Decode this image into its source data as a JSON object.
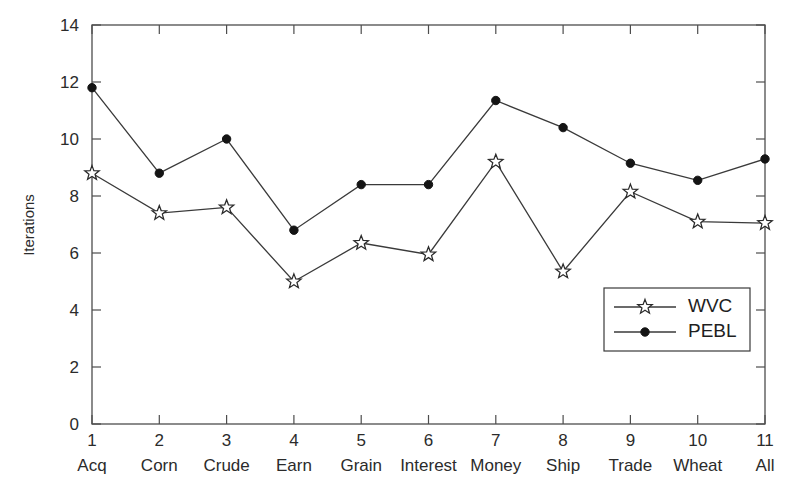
{
  "chart_data": {
    "type": "line",
    "title": "",
    "xlabel": "",
    "ylabel": "Iterations",
    "xlim": [
      1,
      11
    ],
    "ylim": [
      0,
      14
    ],
    "grid": false,
    "legend_position": "bottom-right",
    "x": [
      1,
      2,
      3,
      4,
      5,
      6,
      7,
      8,
      9,
      10,
      11
    ],
    "categories": [
      "Acq",
      "Corn",
      "Crude",
      "Earn",
      "Grain",
      "Interest",
      "Money",
      "Ship",
      "Trade",
      "Wheat",
      "All"
    ],
    "x_tick_labels": [
      "1",
      "2",
      "3",
      "4",
      "5",
      "6",
      "7",
      "8",
      "9",
      "10",
      "11"
    ],
    "y_tick_labels": [
      "0",
      "2",
      "4",
      "6",
      "8",
      "10",
      "12",
      "14"
    ],
    "y_ticks": [
      0,
      2,
      4,
      6,
      8,
      10,
      12,
      14
    ],
    "series": [
      {
        "name": "WVC",
        "marker": "star",
        "values": [
          8.8,
          7.4,
          7.6,
          5.0,
          6.35,
          5.95,
          9.2,
          5.35,
          8.15,
          7.1,
          7.05
        ]
      },
      {
        "name": "PEBL",
        "marker": "circle",
        "values": [
          11.8,
          8.8,
          10.0,
          6.8,
          8.4,
          8.4,
          11.35,
          10.4,
          9.15,
          8.55,
          9.3
        ]
      }
    ],
    "colors": {
      "axis": "#4d4d4d",
      "line": "#3a3a3a",
      "marker_fill": "#141414",
      "background": "#ffffff"
    }
  },
  "legend": {
    "entries": [
      {
        "label": "WVC"
      },
      {
        "label": "PEBL"
      }
    ]
  }
}
